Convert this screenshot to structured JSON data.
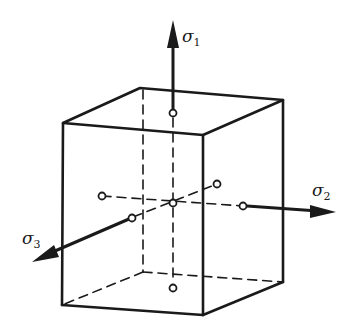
{
  "diagram": {
    "type": "stress-cube",
    "labels": {
      "sigma1": {
        "symbol": "σ",
        "sub": "1"
      },
      "sigma2": {
        "symbol": "σ",
        "sub": "2"
      },
      "sigma3": {
        "symbol": "σ",
        "sub": "3"
      }
    },
    "colors": {
      "stroke": "#1a1a1a",
      "background": "#ffffff"
    }
  }
}
